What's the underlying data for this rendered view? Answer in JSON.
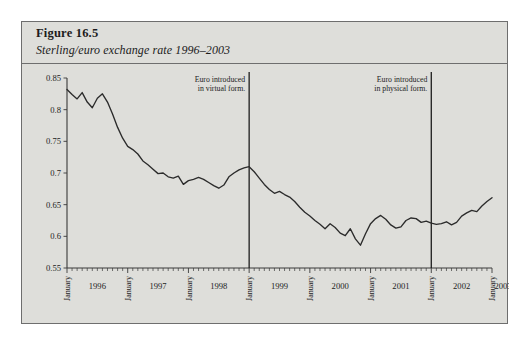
{
  "figure": {
    "label": "Figure 16.5",
    "caption": "Sterling/euro exchange rate 1996–2003"
  },
  "chart_data": {
    "type": "line",
    "title": "Sterling/euro exchange rate 1996–2003",
    "xlabel": "",
    "ylabel": "",
    "ylim": [
      0.55,
      0.85
    ],
    "yticks": [
      0.55,
      0.6,
      0.65,
      0.7,
      0.75,
      0.8,
      0.85
    ],
    "ytick_labels": [
      "0.55",
      "0.6",
      "0.65",
      "0.7",
      "0.75",
      "0.8",
      "0.85"
    ],
    "grid": false,
    "legend": "none",
    "x_year_labels": [
      "1996",
      "1997",
      "1998",
      "1999",
      "2000",
      "2001",
      "2002",
      "2003"
    ],
    "x_month_label": "January",
    "x_minor_tick_interval": "month",
    "annotations": [
      {
        "name": "euro-virtual",
        "lines": [
          "Euro introduced",
          "in virtual form."
        ],
        "x_date": "1999-01",
        "align": "right"
      },
      {
        "name": "euro-physical",
        "lines": [
          "Euro introduced",
          "in physical form."
        ],
        "x_date": "2002-01",
        "align": "right"
      }
    ],
    "series": [
      {
        "name": "Sterling/euro exchange rate",
        "x_start": "1996-01",
        "x_end": "2003-01",
        "x_step": "month",
        "values": [
          0.832,
          0.824,
          0.817,
          0.827,
          0.812,
          0.803,
          0.818,
          0.825,
          0.812,
          0.793,
          0.772,
          0.755,
          0.742,
          0.737,
          0.73,
          0.719,
          0.713,
          0.706,
          0.699,
          0.7,
          0.694,
          0.692,
          0.695,
          0.682,
          0.688,
          0.69,
          0.693,
          0.69,
          0.685,
          0.68,
          0.676,
          0.681,
          0.694,
          0.7,
          0.705,
          0.708,
          0.71,
          0.702,
          0.692,
          0.682,
          0.674,
          0.668,
          0.671,
          0.666,
          0.662,
          0.655,
          0.646,
          0.638,
          0.632,
          0.625,
          0.619,
          0.612,
          0.62,
          0.614,
          0.605,
          0.601,
          0.612,
          0.596,
          0.586,
          0.604,
          0.62,
          0.628,
          0.633,
          0.627,
          0.618,
          0.613,
          0.615,
          0.625,
          0.629,
          0.628,
          0.622,
          0.624,
          0.621,
          0.619,
          0.62,
          0.623,
          0.618,
          0.622,
          0.632,
          0.637,
          0.641,
          0.639,
          0.648,
          0.655,
          0.661
        ]
      }
    ]
  }
}
